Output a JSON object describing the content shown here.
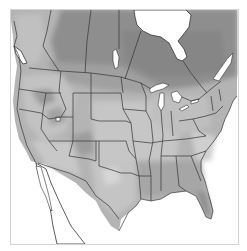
{
  "map": {
    "type": "shaded-relief-choropleth",
    "region": "North America (contiguous US, southern Canada, northern Mexico)",
    "colors": {
      "background": "#ffffff",
      "frame": "#d4d4d4",
      "water": "#ffffff",
      "boundary": "#333333",
      "shade_dark": "#8a8a8a",
      "shade_mid_dark": "#9e9e9e",
      "shade_mid": "#b2b2b2",
      "shade_light": "#c8c8c8",
      "shade_lighter": "#d9d9d9"
    },
    "features": [
      {
        "name": "hudson-bay",
        "kind": "water"
      },
      {
        "name": "great-lakes",
        "kind": "water"
      },
      {
        "name": "lake-winnipeg",
        "kind": "water"
      },
      {
        "name": "gulf-of-california",
        "kind": "water"
      },
      {
        "name": "gulf-of-mexico",
        "kind": "water"
      },
      {
        "name": "atlantic-ocean",
        "kind": "water"
      },
      {
        "name": "pacific-ocean",
        "kind": "water"
      },
      {
        "name": "vancouver-island",
        "kind": "land"
      },
      {
        "name": "baja-california",
        "kind": "land"
      },
      {
        "name": "florida",
        "kind": "land"
      }
    ]
  }
}
